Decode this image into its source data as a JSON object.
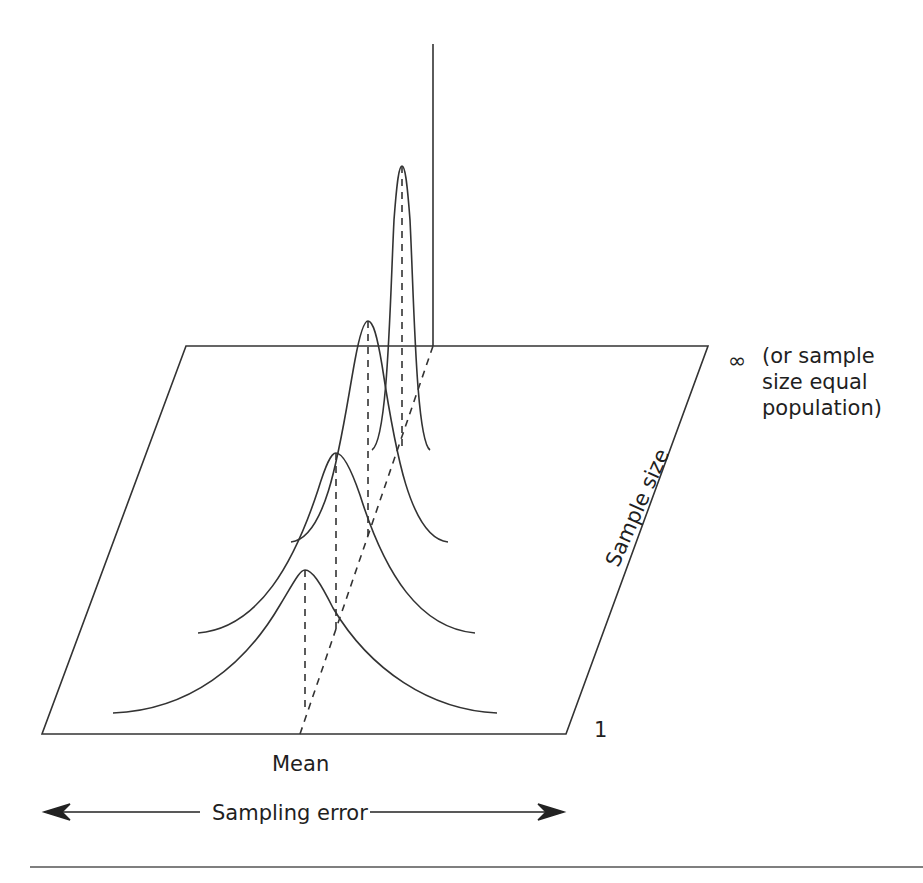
{
  "figure": {
    "labels": {
      "infinity_symbol": "∞",
      "infinity_note_line1": "(or sample",
      "infinity_note_line2": "size equal",
      "infinity_note_line3": "population)",
      "sample_size_min": "1",
      "mean": "Mean",
      "sample_size_axis": "Sample size",
      "sampling_error_axis": "Sampling error"
    },
    "curves": [
      {
        "name": "smallest-sample",
        "peak_x": 305,
        "peak_y": 570,
        "base_y": 713
      },
      {
        "name": "small-sample",
        "peak_x": 336,
        "peak_y": 453,
        "base_y": 633
      },
      {
        "name": "larger-sample",
        "peak_x": 368,
        "peak_y": 321,
        "base_y": 542
      },
      {
        "name": "largest-sample",
        "peak_x": 402,
        "peak_y": 166,
        "base_y": 450
      }
    ],
    "colors": {
      "line": "#333333",
      "background": "#ffffff"
    }
  }
}
